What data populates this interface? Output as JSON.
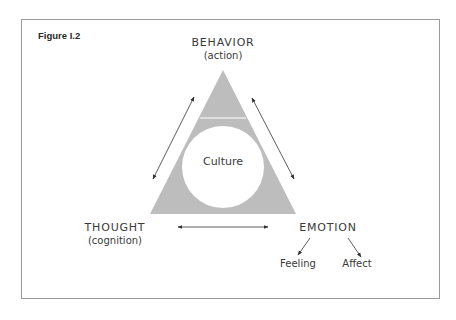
{
  "figure": {
    "label": "Figure I.2"
  },
  "nodes": {
    "behavior": {
      "title": "BEHAVIOR",
      "subtitle": "(action)"
    },
    "thought": {
      "title": "THOUGHT",
      "subtitle": "(cognition)"
    },
    "emotion": {
      "title": "EMOTION",
      "children": [
        "Feeling",
        "Affect"
      ]
    }
  },
  "center": {
    "label": "Culture"
  },
  "colors": {
    "triangle_fill": "#bdbdbd",
    "circle_fill": "#ffffff",
    "text": "#3a3a3a",
    "arrows": "#333333",
    "frame": "#9a9a9a"
  },
  "relations": [
    {
      "from": "BEHAVIOR",
      "to": "THOUGHT",
      "type": "bidirectional"
    },
    {
      "from": "BEHAVIOR",
      "to": "EMOTION",
      "type": "bidirectional"
    },
    {
      "from": "THOUGHT",
      "to": "EMOTION",
      "type": "bidirectional"
    },
    {
      "from": "EMOTION",
      "to": "Feeling",
      "type": "directed"
    },
    {
      "from": "EMOTION",
      "to": "Affect",
      "type": "directed"
    }
  ]
}
